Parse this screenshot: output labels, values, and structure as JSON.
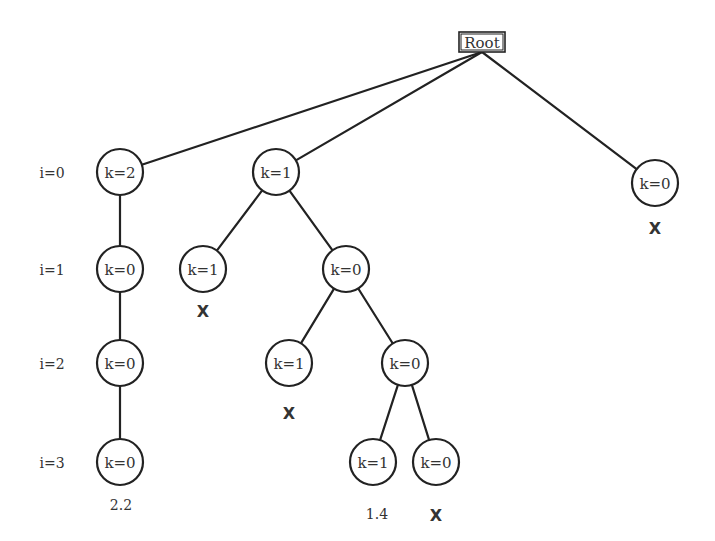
{
  "root": {
    "label": "Root",
    "x": 482,
    "y": 42,
    "w": 46,
    "h": 20
  },
  "levels": [
    {
      "label": "i=0",
      "y": 172
    },
    {
      "label": "i=1",
      "y": 269
    },
    {
      "label": "i=2",
      "y": 363
    },
    {
      "label": "i=3",
      "y": 462
    }
  ],
  "nodes": [
    {
      "id": "n0a",
      "label": "k=2",
      "x": 120,
      "y": 172
    },
    {
      "id": "n0b",
      "label": "k=1",
      "x": 276,
      "y": 172
    },
    {
      "id": "n0c",
      "label": "k=0",
      "x": 655,
      "y": 183
    },
    {
      "id": "n1a",
      "label": "k=0",
      "x": 120,
      "y": 269
    },
    {
      "id": "n1b",
      "label": "k=1",
      "x": 203,
      "y": 269
    },
    {
      "id": "n1c",
      "label": "k=0",
      "x": 346,
      "y": 269
    },
    {
      "id": "n2a",
      "label": "k=0",
      "x": 120,
      "y": 363
    },
    {
      "id": "n2b",
      "label": "k=1",
      "x": 289,
      "y": 363
    },
    {
      "id": "n2c",
      "label": "k=0",
      "x": 405,
      "y": 363
    },
    {
      "id": "n3a",
      "label": "k=0",
      "x": 120,
      "y": 462
    },
    {
      "id": "n3b",
      "label": "k=1",
      "x": 373,
      "y": 462
    },
    {
      "id": "n3c",
      "label": "k=0",
      "x": 436,
      "y": 462
    }
  ],
  "edges": [
    {
      "from": "root",
      "to": "n0a"
    },
    {
      "from": "root",
      "to": "n0b"
    },
    {
      "from": "root",
      "to": "n0c"
    },
    {
      "from": "n0a",
      "to": "n1a"
    },
    {
      "from": "n1a",
      "to": "n2a"
    },
    {
      "from": "n2a",
      "to": "n3a"
    },
    {
      "from": "n0b",
      "to": "n1b"
    },
    {
      "from": "n0b",
      "to": "n1c"
    },
    {
      "from": "n1c",
      "to": "n2b"
    },
    {
      "from": "n1c",
      "to": "n2c"
    },
    {
      "from": "n2c",
      "to": "n3b"
    },
    {
      "from": "n2c",
      "to": "n3c"
    }
  ],
  "annotations": [
    {
      "node": "n0c",
      "text": "X",
      "type": "pruned",
      "x": 655,
      "y": 228
    },
    {
      "node": "n1b",
      "text": "X",
      "type": "pruned",
      "x": 203,
      "y": 311
    },
    {
      "node": "n2b",
      "text": "X",
      "type": "pruned",
      "x": 289,
      "y": 413
    },
    {
      "node": "n3a",
      "text": "2.2",
      "type": "value",
      "x": 121,
      "y": 505
    },
    {
      "node": "n3b",
      "text": "1.4",
      "type": "value",
      "x": 377,
      "y": 514
    },
    {
      "node": "n3c",
      "text": "X",
      "type": "pruned",
      "x": 436,
      "y": 515
    }
  ],
  "style": {
    "node_radius": 23,
    "stroke_color": "#222222",
    "text_color": "#333333",
    "background": "#ffffff"
  }
}
